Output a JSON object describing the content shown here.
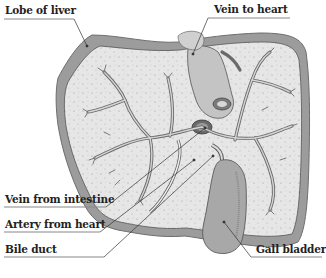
{
  "diagram": {
    "labels": [
      {
        "id": "lobe",
        "text": "Lobe of liver",
        "x": 5,
        "y": 3
      },
      {
        "id": "vein_to_heart",
        "text": "Vein to heart",
        "x": 213,
        "y": 3
      },
      {
        "id": "vein_from_intestine",
        "text": "Vein from intestine",
        "x": 6,
        "y": 192
      },
      {
        "id": "artery_from_heart",
        "text": "Artery from heart",
        "x": 6,
        "y": 217
      },
      {
        "id": "bile_duct",
        "text": "Bile duct",
        "x": 6,
        "y": 242
      },
      {
        "id": "gall_bladder",
        "text": "Gall bladder",
        "x": 256,
        "y": 242
      }
    ],
    "colors": {
      "capsule": "#9a9a9a",
      "tissue": "#e4e4e4",
      "vessel": "#c8c8c8",
      "outline": "#555555",
      "gall_bladder": "#a8a8a8",
      "leader": "#333333",
      "underline": "#888888"
    }
  }
}
